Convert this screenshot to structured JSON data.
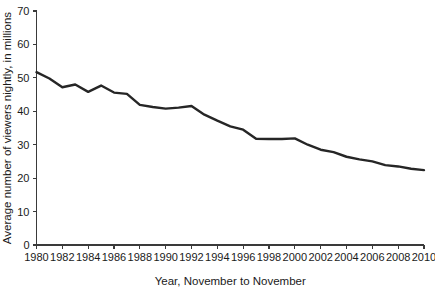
{
  "chart_data": {
    "type": "line",
    "title": "",
    "xlabel": "Year, November to November",
    "ylabel": "Average number of viewers nightly, in millions",
    "xlim": [
      1980,
      2010
    ],
    "ylim": [
      0,
      70
    ],
    "grid": false,
    "legend": null,
    "x_tick_labels": [
      "1980",
      "1982",
      "1984",
      "1986",
      "1988",
      "1990",
      "1992",
      "1994",
      "1996",
      "1998",
      "2000",
      "2002",
      "2004",
      "2006",
      "2008",
      "2010"
    ],
    "x_tick_values": [
      1980,
      1982,
      1984,
      1986,
      1988,
      1990,
      1992,
      1994,
      1996,
      1998,
      2000,
      2002,
      2004,
      2006,
      2008,
      2010
    ],
    "y_tick_labels": [
      "0",
      "10",
      "20",
      "30",
      "40",
      "50",
      "60",
      "70"
    ],
    "y_tick_values": [
      0,
      10,
      20,
      30,
      40,
      50,
      60,
      70
    ],
    "series": [
      {
        "name": "Average nightly viewers",
        "color": "#262626",
        "x": [
          1980,
          1981,
          1982,
          1983,
          1984,
          1985,
          1986,
          1987,
          1988,
          1989,
          1990,
          1991,
          1992,
          1993,
          1994,
          1995,
          1996,
          1997,
          1998,
          1999,
          2000,
          2001,
          2002,
          2003,
          2004,
          2005,
          2006,
          2007,
          2008,
          2009,
          2010
        ],
        "values": [
          51.7,
          49.8,
          47.2,
          48.0,
          45.8,
          47.7,
          45.6,
          45.2,
          41.9,
          41.3,
          40.8,
          41.1,
          41.6,
          39.0,
          37.2,
          35.5,
          34.5,
          31.8,
          31.7,
          31.7,
          31.9,
          30.0,
          28.5,
          27.8,
          26.4,
          25.6,
          25.0,
          23.9,
          23.5,
          22.8,
          22.4
        ]
      }
    ]
  },
  "axis": {
    "x_title": "Year, November to November",
    "y_title": "Average number of viewers nightly, in millions"
  },
  "colors": {
    "line": "#262626",
    "axis": "#3a3a3a",
    "text": "#1a1a1a",
    "background": "#ffffff"
  }
}
